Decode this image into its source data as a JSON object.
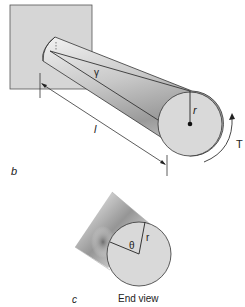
{
  "figure_b": {
    "panel_label": "b",
    "length_label": "l",
    "shear_strain_label": "γ",
    "radius_label": "r",
    "torque_label": "T"
  },
  "figure_c": {
    "panel_label": "c",
    "caption": "End view",
    "angle_label": "θ",
    "radius_label": "r"
  },
  "colors": {
    "wall_fill": "#d6d6d6",
    "end_face_fill": "#d9d9d9",
    "outline": "#333333"
  }
}
